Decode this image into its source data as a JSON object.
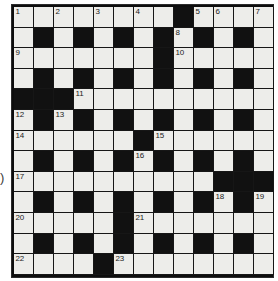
{
  "puzzle": {
    "type": "crossword-grid",
    "title": "",
    "rows": 13,
    "cols": 13,
    "colors": {
      "white_cell": "#ededea",
      "black_cell": "#111111",
      "grid_line": "#161616",
      "number_text": "#232323",
      "page_background": "#ffffff"
    },
    "margin_glyph": ")",
    "legend": {
      "white": "open letter square",
      "black": "blocked square"
    },
    "grid": [
      [
        "W1",
        "W",
        "W2",
        "W",
        "W3",
        "W",
        "W4",
        "W",
        "B",
        "W5",
        "W6",
        "W",
        "W7"
      ],
      [
        "W",
        "B",
        "W",
        "B",
        "W",
        "B",
        "W",
        "B",
        "W8",
        "B",
        "W",
        "B",
        "W"
      ],
      [
        "W9",
        "W",
        "W",
        "W",
        "W",
        "W",
        "W",
        "B",
        "W10",
        "W",
        "W",
        "W",
        "W"
      ],
      [
        "W",
        "B",
        "W",
        "B",
        "W",
        "B",
        "W",
        "B",
        "W",
        "B",
        "W",
        "B",
        "W"
      ],
      [
        "B",
        "B",
        "B",
        "W11",
        "W",
        "W",
        "W",
        "W",
        "W",
        "W",
        "W",
        "W",
        "W"
      ],
      [
        "W12",
        "B",
        "W13",
        "B",
        "W",
        "B",
        "W",
        "B",
        "W",
        "B",
        "W",
        "B",
        "W"
      ],
      [
        "W14",
        "W",
        "W",
        "W",
        "W",
        "W",
        "B",
        "W15",
        "W",
        "W",
        "W",
        "W",
        "W"
      ],
      [
        "W",
        "B",
        "W",
        "B",
        "W",
        "B",
        "W16",
        "B",
        "W",
        "B",
        "W",
        "B",
        "W"
      ],
      [
        "W17",
        "W",
        "W",
        "W",
        "W",
        "W",
        "W",
        "W",
        "W",
        "W",
        "B",
        "B",
        "B"
      ],
      [
        "W",
        "B",
        "W",
        "B",
        "W",
        "B",
        "W",
        "B",
        "W",
        "B",
        "W18",
        "B",
        "W19"
      ],
      [
        "W20",
        "W",
        "W",
        "W",
        "W",
        "B",
        "W21",
        "W",
        "W",
        "W",
        "W",
        "W",
        "W"
      ],
      [
        "W",
        "B",
        "W",
        "B",
        "W",
        "B",
        "W",
        "B",
        "W",
        "B",
        "W",
        "B",
        "W"
      ],
      [
        "W22",
        "W",
        "W",
        "W",
        "B",
        "W23",
        "W",
        "W",
        "W",
        "W",
        "W",
        "W",
        "W"
      ]
    ],
    "numbers": [
      {
        "n": "1",
        "row": 1,
        "col": 1
      },
      {
        "n": "2",
        "row": 1,
        "col": 3
      },
      {
        "n": "3",
        "row": 1,
        "col": 5
      },
      {
        "n": "4",
        "row": 1,
        "col": 7
      },
      {
        "n": "5",
        "row": 1,
        "col": 10
      },
      {
        "n": "6",
        "row": 1,
        "col": 11
      },
      {
        "n": "7",
        "row": 1,
        "col": 13
      },
      {
        "n": "8",
        "row": 2,
        "col": 9
      },
      {
        "n": "9",
        "row": 3,
        "col": 1
      },
      {
        "n": "10",
        "row": 3,
        "col": 9
      },
      {
        "n": "11",
        "row": 5,
        "col": 4
      },
      {
        "n": "12",
        "row": 6,
        "col": 1
      },
      {
        "n": "13",
        "row": 6,
        "col": 3
      },
      {
        "n": "14",
        "row": 7,
        "col": 1
      },
      {
        "n": "15",
        "row": 7,
        "col": 8
      },
      {
        "n": "16",
        "row": 8,
        "col": 7
      },
      {
        "n": "17",
        "row": 9,
        "col": 1
      },
      {
        "n": "18",
        "row": 10,
        "col": 11
      },
      {
        "n": "19",
        "row": 10,
        "col": 13
      },
      {
        "n": "20",
        "row": 11,
        "col": 1
      },
      {
        "n": "21",
        "row": 11,
        "col": 7
      },
      {
        "n": "22",
        "row": 13,
        "col": 1
      },
      {
        "n": "23",
        "row": 13,
        "col": 6
      }
    ]
  }
}
